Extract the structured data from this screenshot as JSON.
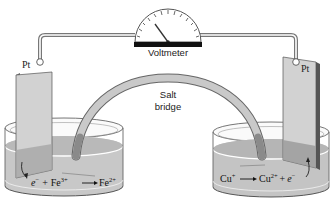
{
  "diagram": {
    "voltmeter": {
      "label": "Voltmeter",
      "icon": "voltmeter-gauge-icon"
    },
    "salt_bridge": {
      "label_line1": "Salt",
      "label_line2": "bridge"
    },
    "left_cell": {
      "electrode_label": "Pt",
      "reaction": {
        "reactant_electron": "e",
        "electron_charge": "−",
        "plus": "+",
        "reactant_ion": "Fe",
        "reactant_charge": "3+",
        "arrow": "⟶",
        "product_ion": "Fe",
        "product_charge": "2+"
      }
    },
    "right_cell": {
      "electrode_label": "Pt",
      "reaction": {
        "reactant_ion": "Cu",
        "reactant_charge": "+",
        "arrow": "⟶",
        "product_ion": "Cu",
        "product_charge": "2+",
        "plus": "+",
        "product_electron": "e",
        "electron_charge": "−"
      }
    },
    "colors": {
      "solution": "#c8c8c8",
      "solution_dark": "#a9a9a9",
      "electrode": "#cfcfcf",
      "electrode_edge": "#555555",
      "wire": "#888888",
      "voltmeter_base": "#111111",
      "bridge": "#bdbdbd"
    }
  }
}
